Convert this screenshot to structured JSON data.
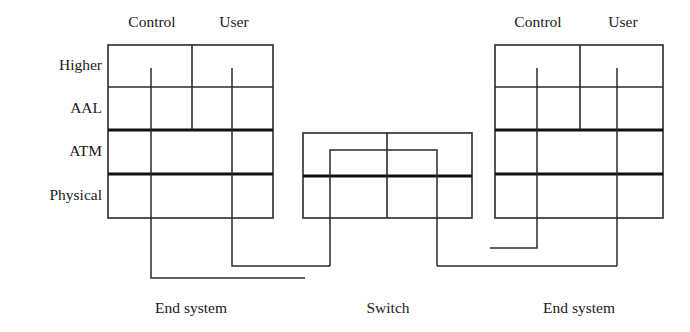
{
  "figure": {
    "clipped_header": "ATM protocol architecture",
    "layer_labels": [
      "Higher",
      "AAL",
      "ATM",
      "Physical"
    ],
    "plane_labels": [
      "Control",
      "User"
    ],
    "nodes": [
      {
        "label": "End system"
      },
      {
        "label": "Switch"
      },
      {
        "label": "End system"
      }
    ]
  },
  "colors": {
    "line": "#2b2b2b",
    "thick_line": "#111111",
    "background": "#ffffff",
    "text": "#1a1a1a"
  },
  "geometry": {
    "left_stack": {
      "x0": 108,
      "x1": 273,
      "plane_divider_x": 192,
      "control_x": 151,
      "user_x": 232
    },
    "switch": {
      "x0": 303,
      "x1": 472,
      "y0": 133,
      "y1": 218,
      "divider_y": 176,
      "center_x": 387,
      "inner_x0": 330,
      "inner_x1": 437,
      "inner_y0": 150
    },
    "right_stack": {
      "x0": 495,
      "x1": 663,
      "plane_divider_x": 580,
      "control_x": 537,
      "user_x": 617
    },
    "rows_y": [
      45,
      87,
      130,
      174,
      218
    ],
    "control_bus_y": 278,
    "user_bus_y": 266,
    "right_control_bus_y": 248
  }
}
